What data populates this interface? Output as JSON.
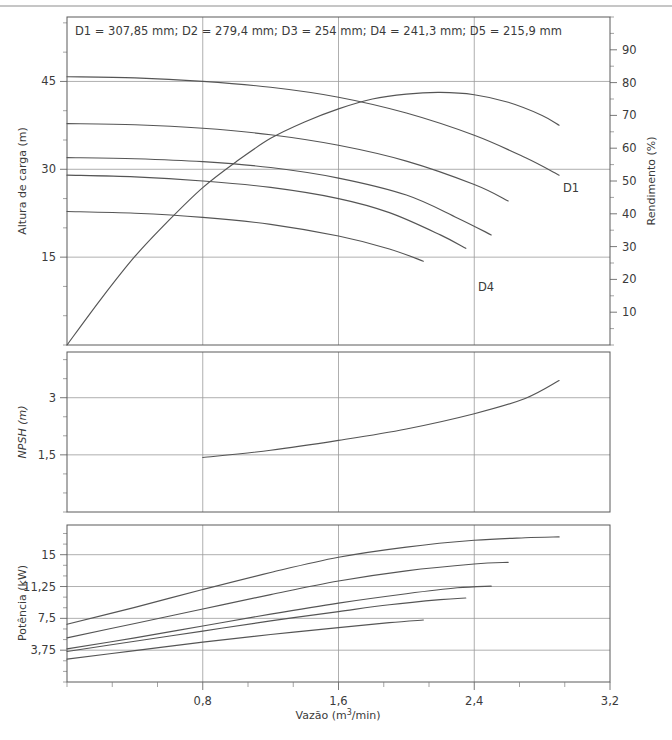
{
  "figure": {
    "note": "D1 = 307,85 mm; D2 = 279,4 mm; D3 = 254 mm; D4 = 241,3 mm; D5 = 215,9 mm",
    "xlabel": "Vazão (m³/min)",
    "x_ticks": [
      "0,8",
      "1,6",
      "2,4",
      "3,2"
    ],
    "line_color": "#555555",
    "grid_color": "#9a9a9a",
    "frame_color": "#5a5a5a",
    "text_color": "#3b3b3b"
  },
  "panel_head": {
    "ylabel": "Altura de carga (m)",
    "y_ticks": [
      "15",
      "30",
      "45"
    ],
    "ylabel_right": "Rendimento (%)",
    "y_ticks_right": [
      "10",
      "20",
      "30",
      "40",
      "50",
      "60",
      "70",
      "80",
      "90"
    ],
    "curve_label_d1": "D1",
    "curve_label_d4": "D4"
  },
  "panel_npsh": {
    "ylabel": "NPSH (m)",
    "y_ticks": [
      "1,5",
      "3"
    ]
  },
  "panel_power": {
    "ylabel": "Potência (kW)",
    "y_ticks": [
      "3,75",
      "7,5",
      "11,25",
      "15"
    ]
  },
  "chart_data": {
    "type": "line",
    "title": "",
    "xlabel": "Vazão (m³/min)",
    "xlim": [
      0,
      3.2
    ],
    "xticks": [
      0.8,
      1.6,
      2.4,
      3.2
    ],
    "grid": true,
    "legend": "inline curve labels (D1, D4)",
    "impeller_diameters_mm": {
      "D1": 307.85,
      "D2": 279.4,
      "D3": 254,
      "D4": 241.3,
      "D5": 215.9
    },
    "panels": [
      {
        "name": "head",
        "ylabel": "Altura de carga (m)",
        "ylim": [
          0,
          56
        ],
        "yticks": [
          15,
          30,
          45
        ],
        "y2label": "Rendimento (%)",
        "y2lim": [
          0,
          100
        ],
        "y2ticks": [
          10,
          20,
          30,
          40,
          50,
          60,
          70,
          80,
          90
        ],
        "series": [
          {
            "name": "D1",
            "axis": "left",
            "x": [
              0.0,
              0.4,
              0.8,
              1.2,
              1.6,
              2.0,
              2.4,
              2.7,
              2.9
            ],
            "values": [
              45.8,
              45.6,
              45.0,
              44.0,
              42.3,
              39.6,
              35.8,
              32.0,
              29.0
            ]
          },
          {
            "name": "D2",
            "axis": "left",
            "x": [
              0.0,
              0.4,
              0.8,
              1.2,
              1.6,
              2.0,
              2.4,
              2.6
            ],
            "values": [
              37.8,
              37.6,
              37.0,
              35.9,
              34.1,
              31.4,
              27.4,
              24.6
            ]
          },
          {
            "name": "D3",
            "axis": "left",
            "x": [
              0.0,
              0.4,
              0.8,
              1.2,
              1.6,
              2.0,
              2.3,
              2.5
            ],
            "values": [
              32.0,
              31.8,
              31.3,
              30.3,
              28.5,
              25.6,
              21.7,
              18.8
            ]
          },
          {
            "name": "D4",
            "axis": "left",
            "x": [
              0.0,
              0.4,
              0.8,
              1.2,
              1.6,
              1.9,
              2.2,
              2.35
            ],
            "values": [
              29.0,
              28.7,
              28.0,
              26.9,
              25.0,
              22.6,
              18.8,
              16.5
            ]
          },
          {
            "name": "D5",
            "axis": "left",
            "x": [
              0.0,
              0.4,
              0.8,
              1.2,
              1.6,
              1.9,
              2.1
            ],
            "values": [
              22.8,
              22.5,
              21.8,
              20.6,
              18.6,
              16.4,
              14.3
            ]
          },
          {
            "name": "Rendimento",
            "axis": "right",
            "x": [
              0.0,
              0.2,
              0.4,
              0.6,
              0.8,
              1.0,
              1.2,
              1.4,
              1.6,
              1.8,
              2.0,
              2.2,
              2.4,
              2.6,
              2.8,
              2.9
            ],
            "values": [
              0,
              14,
              27,
              38,
              48,
              56,
              63,
              68,
              72,
              75,
              76.5,
              77,
              76.3,
              74,
              70,
              67
            ]
          }
        ]
      },
      {
        "name": "npsh",
        "ylabel": "NPSH (m)",
        "ylim": [
          0,
          4.2
        ],
        "yticks": [
          1.5,
          3.0
        ],
        "series": [
          {
            "name": "NPSH",
            "x": [
              0.8,
              1.2,
              1.6,
              2.0,
              2.4,
              2.7,
              2.9
            ],
            "values": [
              1.43,
              1.62,
              1.88,
              2.18,
              2.58,
              2.98,
              3.45
            ]
          }
        ]
      },
      {
        "name": "power",
        "ylabel": "Potência (kW)",
        "ylim": [
          0,
          18.5
        ],
        "yticks": [
          3.75,
          7.5,
          11.25,
          15
        ],
        "series": [
          {
            "name": "D1",
            "x": [
              0.0,
              0.4,
              0.8,
              1.2,
              1.6,
              2.0,
              2.4,
              2.7,
              2.9
            ],
            "values": [
              6.8,
              8.8,
              10.9,
              12.9,
              14.7,
              15.9,
              16.7,
              17.0,
              17.1
            ]
          },
          {
            "name": "D2",
            "x": [
              0.0,
              0.4,
              0.8,
              1.2,
              1.6,
              2.0,
              2.4,
              2.6
            ],
            "values": [
              5.2,
              6.9,
              8.6,
              10.3,
              11.9,
              13.1,
              13.9,
              14.1
            ]
          },
          {
            "name": "D3",
            "x": [
              0.0,
              0.4,
              0.8,
              1.2,
              1.6,
              2.0,
              2.3,
              2.5
            ],
            "values": [
              3.9,
              5.2,
              6.6,
              8.0,
              9.3,
              10.4,
              11.1,
              11.3
            ]
          },
          {
            "name": "D4",
            "x": [
              0.0,
              0.4,
              0.8,
              1.2,
              1.6,
              1.9,
              2.2,
              2.35
            ],
            "values": [
              3.6,
              4.8,
              6.0,
              7.2,
              8.3,
              9.1,
              9.7,
              9.9
            ]
          },
          {
            "name": "D5",
            "x": [
              0.0,
              0.4,
              0.8,
              1.2,
              1.6,
              1.9,
              2.1
            ],
            "values": [
              2.7,
              3.7,
              4.7,
              5.6,
              6.4,
              7.0,
              7.3
            ]
          }
        ]
      }
    ]
  }
}
